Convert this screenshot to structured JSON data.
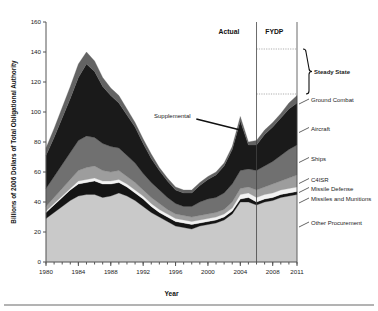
{
  "chart_data": {
    "type": "area",
    "title": "",
    "xlabel": "Year",
    "ylabel": "Billions of 2006 Dollars of Total Obligational Authority",
    "xlim": [
      1980,
      2011
    ],
    "ylim": [
      0,
      160
    ],
    "grid": false,
    "legend_position": "right-callouts",
    "xticks": [
      1980,
      1984,
      1988,
      1992,
      1996,
      2000,
      2004,
      2008,
      2011
    ],
    "xtick_labels": [
      "1980",
      "1984",
      "1988",
      "1992",
      "1996",
      "2000",
      "2004",
      "2008",
      "2011"
    ],
    "yticks": [
      0,
      20,
      40,
      60,
      80,
      100,
      120,
      140,
      160
    ],
    "ytick_labels": [
      "0",
      "20",
      "40",
      "60",
      "80",
      "100",
      "120",
      "140",
      "160"
    ],
    "minor_xtick_interval": 1,
    "x": [
      1980,
      1981,
      1982,
      1983,
      1984,
      1985,
      1986,
      1987,
      1988,
      1989,
      1990,
      1991,
      1992,
      1993,
      1994,
      1995,
      1996,
      1997,
      1998,
      1999,
      2000,
      2001,
      2002,
      2003,
      2004,
      2005,
      2006,
      2007,
      2008,
      2009,
      2010,
      2011
    ],
    "series": [
      {
        "name": "Other Procurement",
        "color": "#c9c9c9",
        "values": [
          29,
          33,
          37,
          41,
          44,
          45,
          45,
          43,
          44,
          46,
          44,
          41,
          37,
          33,
          30,
          27,
          24,
          23,
          22,
          24,
          25,
          26,
          28,
          32,
          40,
          40,
          38,
          40,
          41,
          43,
          44,
          45
        ]
      },
      {
        "name": "Missiles and Munitions",
        "color": "#141414",
        "values": [
          4,
          5,
          6,
          7,
          8,
          8,
          9,
          9,
          8,
          7,
          6,
          5,
          5,
          4,
          3,
          3,
          3,
          3,
          3,
          2,
          2,
          2,
          2,
          2,
          2,
          3,
          2,
          2,
          2,
          2,
          2,
          2
        ]
      },
      {
        "name": "Missile Defense",
        "color": "#f2f2f2",
        "values": [
          1,
          1,
          1,
          1,
          2,
          2,
          2,
          2,
          2,
          2,
          2,
          2,
          2,
          2,
          2,
          2,
          2,
          2,
          2,
          2,
          2,
          2,
          2,
          2,
          3,
          3,
          3,
          3,
          3,
          3,
          3,
          3
        ]
      },
      {
        "name": "C4ISR",
        "color": "#9d9d9d",
        "values": [
          3,
          4,
          5,
          6,
          7,
          8,
          8,
          7,
          6,
          6,
          5,
          5,
          4,
          4,
          4,
          3,
          3,
          3,
          3,
          3,
          3,
          3,
          3,
          4,
          4,
          4,
          5,
          5,
          6,
          6,
          7,
          8
        ]
      },
      {
        "name": "Ships",
        "color": "#707070",
        "values": [
          12,
          14,
          16,
          18,
          20,
          21,
          19,
          18,
          17,
          15,
          14,
          13,
          11,
          10,
          9,
          8,
          7,
          6,
          7,
          9,
          10,
          10,
          11,
          12,
          12,
          12,
          13,
          14,
          15,
          17,
          19,
          20
        ]
      },
      {
        "name": "Aircraft",
        "color": "#1a1a1a",
        "values": [
          22,
          26,
          31,
          36,
          42,
          48,
          44,
          38,
          34,
          30,
          27,
          24,
          20,
          16,
          13,
          11,
          9,
          9,
          9,
          11,
          13,
          15,
          18,
          23,
          33,
          16,
          17,
          21,
          23,
          25,
          27,
          28
        ]
      },
      {
        "name": "Ground Combat",
        "color": "#636363",
        "values": [
          5,
          6,
          7,
          8,
          9,
          8,
          7,
          6,
          5,
          5,
          4,
          3,
          3,
          3,
          2,
          2,
          2,
          2,
          2,
          2,
          2,
          2,
          2,
          2,
          3,
          2,
          3,
          3,
          3,
          3,
          4,
          5
        ]
      }
    ],
    "annotations": [
      {
        "name": "actual-label",
        "text": "Actual",
        "x_year": 2002.6,
        "y_value": 152
      },
      {
        "name": "fydp-label",
        "text": "FYDP",
        "x_year": 2008.2,
        "y_value": 152
      },
      {
        "name": "supplemental-label",
        "text": "Supplemental",
        "x_year": 1995.6,
        "y_value": 96
      },
      {
        "name": "steady-state-label",
        "text": "Steady State",
        "x_value": 127
      }
    ],
    "reference_lines": [
      {
        "name": "actual-fydp-divider",
        "x_year": 2006
      },
      {
        "name": "plot-right-edge",
        "x_year": 2011
      }
    ],
    "steady_state_band": {
      "low": 112,
      "high": 142,
      "from_year": 2006,
      "to_year": 2011
    },
    "callouts": [
      {
        "name": "callout-ground-combat",
        "label": "Ground Combat",
        "y_value": 108
      },
      {
        "name": "callout-aircraft",
        "label": "Aircraft",
        "y_value": 89
      },
      {
        "name": "callout-ships",
        "label": "Ships",
        "y_value": 69
      },
      {
        "name": "callout-c4isr",
        "label": "C4ISR",
        "y_value": 55
      },
      {
        "name": "callout-missile-defense",
        "label": "Missile Defense",
        "y_value": 49
      },
      {
        "name": "callout-missiles-munitions",
        "label": "Missiles and Munitions",
        "y_value": 42
      },
      {
        "name": "callout-other-procurement",
        "label": "Other Procurement",
        "y_value": 26
      }
    ]
  }
}
